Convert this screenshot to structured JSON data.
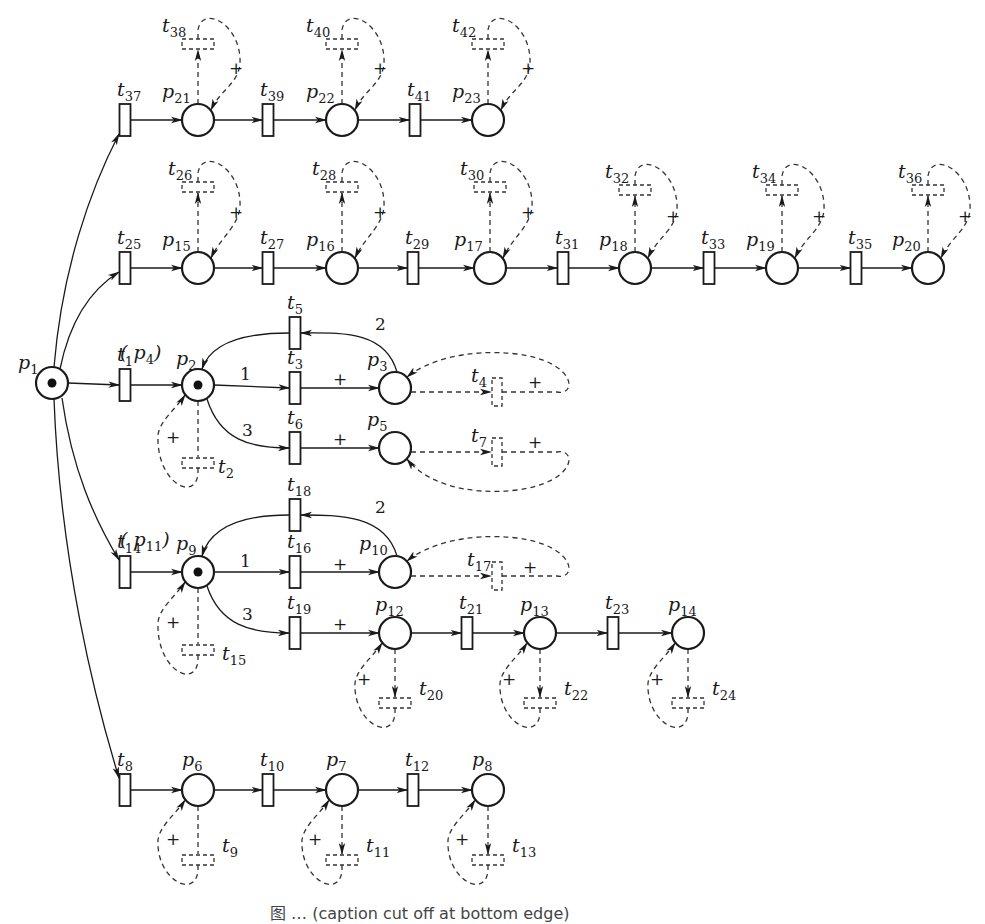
{
  "diagram": {
    "type": "petri-net",
    "caption": "图 … (caption cut off at bottom edge)",
    "places": [
      {
        "id": "p1",
        "x": 52,
        "y": 383,
        "token": true,
        "label_dx": -34,
        "label_dy": -14
      },
      {
        "id": "p2",
        "x": 198,
        "y": 385,
        "token": true,
        "label_dx": -22,
        "label_dy": -20,
        "alias": "(p4)"
      },
      {
        "id": "p3",
        "x": 395,
        "y": 388,
        "token": false,
        "label_dx": -28,
        "label_dy": -22
      },
      {
        "id": "p5",
        "x": 395,
        "y": 448,
        "token": false,
        "label_dx": -28,
        "label_dy": -22
      },
      {
        "id": "p9",
        "x": 198,
        "y": 572,
        "token": true,
        "label_dx": -22,
        "label_dy": -22,
        "alias": "(p11)"
      },
      {
        "id": "p10",
        "x": 395,
        "y": 572,
        "token": false,
        "label_dx": -36,
        "label_dy": -22
      },
      {
        "id": "p12",
        "x": 395,
        "y": 633,
        "token": false,
        "label_dx": -20,
        "label_dy": -22
      },
      {
        "id": "p13",
        "x": 540,
        "y": 633,
        "token": false,
        "label_dx": -20,
        "label_dy": -22
      },
      {
        "id": "p14",
        "x": 688,
        "y": 633,
        "token": false,
        "label_dx": -20,
        "label_dy": -22
      },
      {
        "id": "p6",
        "x": 198,
        "y": 790,
        "token": false,
        "label_dx": -16,
        "label_dy": -24
      },
      {
        "id": "p7",
        "x": 342,
        "y": 790,
        "token": false,
        "label_dx": -16,
        "label_dy": -24
      },
      {
        "id": "p8",
        "x": 488,
        "y": 790,
        "token": false,
        "label_dx": -16,
        "label_dy": -24
      },
      {
        "id": "p15",
        "x": 198,
        "y": 268,
        "token": false,
        "label_dx": -36,
        "label_dy": -22
      },
      {
        "id": "p16",
        "x": 342,
        "y": 268,
        "token": false,
        "label_dx": -36,
        "label_dy": -22
      },
      {
        "id": "p17",
        "x": 490,
        "y": 268,
        "token": false,
        "label_dx": -36,
        "label_dy": -22
      },
      {
        "id": "p18",
        "x": 635,
        "y": 268,
        "token": false,
        "label_dx": -36,
        "label_dy": -22
      },
      {
        "id": "p19",
        "x": 782,
        "y": 268,
        "token": false,
        "label_dx": -36,
        "label_dy": -22
      },
      {
        "id": "p20",
        "x": 928,
        "y": 268,
        "token": false,
        "label_dx": -36,
        "label_dy": -22
      },
      {
        "id": "p21",
        "x": 198,
        "y": 120,
        "token": false,
        "label_dx": -36,
        "label_dy": -22
      },
      {
        "id": "p22",
        "x": 342,
        "y": 120,
        "token": false,
        "label_dx": -36,
        "label_dy": -22
      },
      {
        "id": "p23",
        "x": 488,
        "y": 120,
        "token": false,
        "label_dx": -36,
        "label_dy": -22
      }
    ],
    "transitions": [
      {
        "id": "t1",
        "x": 125,
        "y": 385,
        "visible": true
      },
      {
        "id": "t3",
        "x": 295,
        "y": 388,
        "visible": true
      },
      {
        "id": "t5",
        "x": 295,
        "y": 333,
        "visible": true
      },
      {
        "id": "t6",
        "x": 295,
        "y": 448,
        "visible": true
      },
      {
        "id": "t8",
        "x": 125,
        "y": 790,
        "visible": true
      },
      {
        "id": "t10",
        "x": 268,
        "y": 790,
        "visible": true
      },
      {
        "id": "t12",
        "x": 413,
        "y": 790,
        "visible": true
      },
      {
        "id": "t14",
        "x": 125,
        "y": 572,
        "visible": true
      },
      {
        "id": "t16",
        "x": 295,
        "y": 572,
        "visible": true
      },
      {
        "id": "t18",
        "x": 295,
        "y": 515,
        "visible": true
      },
      {
        "id": "t19",
        "x": 295,
        "y": 633,
        "visible": true
      },
      {
        "id": "t21",
        "x": 467,
        "y": 633,
        "visible": true
      },
      {
        "id": "t23",
        "x": 613,
        "y": 633,
        "visible": true
      },
      {
        "id": "t25",
        "x": 125,
        "y": 268,
        "visible": true
      },
      {
        "id": "t27",
        "x": 268,
        "y": 268,
        "visible": true
      },
      {
        "id": "t29",
        "x": 413,
        "y": 268,
        "visible": true
      },
      {
        "id": "t31",
        "x": 563,
        "y": 268,
        "visible": true
      },
      {
        "id": "t33",
        "x": 709,
        "y": 268,
        "visible": true
      },
      {
        "id": "t35",
        "x": 856,
        "y": 268,
        "visible": true
      },
      {
        "id": "t37",
        "x": 125,
        "y": 120,
        "visible": true
      },
      {
        "id": "t39",
        "x": 268,
        "y": 120,
        "visible": true
      },
      {
        "id": "t41",
        "x": 415,
        "y": 120,
        "visible": true
      },
      {
        "id": "t2",
        "x": 198,
        "y": 463,
        "visible": false,
        "orient": "h"
      },
      {
        "id": "t4",
        "x": 497,
        "y": 392,
        "visible": false,
        "orient": "v"
      },
      {
        "id": "t7",
        "x": 497,
        "y": 452,
        "visible": false,
        "orient": "v"
      },
      {
        "id": "t9",
        "x": 198,
        "y": 860,
        "visible": false,
        "orient": "h"
      },
      {
        "id": "t11",
        "x": 342,
        "y": 860,
        "visible": false,
        "orient": "h"
      },
      {
        "id": "t13",
        "x": 488,
        "y": 860,
        "visible": false,
        "orient": "h"
      },
      {
        "id": "t15",
        "x": 198,
        "y": 650,
        "visible": false,
        "orient": "h"
      },
      {
        "id": "t17",
        "x": 497,
        "y": 576,
        "visible": false,
        "orient": "v"
      },
      {
        "id": "t20",
        "x": 395,
        "y": 703,
        "visible": false,
        "orient": "h"
      },
      {
        "id": "t22",
        "x": 540,
        "y": 703,
        "visible": false,
        "orient": "h"
      },
      {
        "id": "t24",
        "x": 688,
        "y": 703,
        "visible": false,
        "orient": "h"
      },
      {
        "id": "t26",
        "x": 198,
        "y": 187,
        "visible": false,
        "orient": "h"
      },
      {
        "id": "t28",
        "x": 342,
        "y": 187,
        "visible": false,
        "orient": "h"
      },
      {
        "id": "t30",
        "x": 490,
        "y": 187,
        "visible": false,
        "orient": "h"
      },
      {
        "id": "t32",
        "x": 635,
        "y": 190,
        "visible": false,
        "orient": "h"
      },
      {
        "id": "t34",
        "x": 782,
        "y": 190,
        "visible": false,
        "orient": "h"
      },
      {
        "id": "t36",
        "x": 928,
        "y": 190,
        "visible": false,
        "orient": "h"
      },
      {
        "id": "t38",
        "x": 198,
        "y": 44,
        "visible": false,
        "orient": "h"
      },
      {
        "id": "t40",
        "x": 342,
        "y": 44,
        "visible": false,
        "orient": "h"
      },
      {
        "id": "t42",
        "x": 488,
        "y": 44,
        "visible": false,
        "orient": "h"
      }
    ],
    "arc_weights": [
      {
        "text": "1",
        "x": 240,
        "y": 380
      },
      {
        "text": "3",
        "x": 242,
        "y": 436
      },
      {
        "text": "2",
        "x": 375,
        "y": 330
      },
      {
        "text": "1",
        "x": 240,
        "y": 567
      },
      {
        "text": "3",
        "x": 242,
        "y": 620
      },
      {
        "text": "2",
        "x": 375,
        "y": 513
      }
    ],
    "plus_marks": [
      {
        "x": 333,
        "y": 385
      },
      {
        "x": 333,
        "y": 445
      },
      {
        "x": 528,
        "y": 388
      },
      {
        "x": 528,
        "y": 448
      },
      {
        "x": 166,
        "y": 443
      },
      {
        "x": 333,
        "y": 570
      },
      {
        "x": 333,
        "y": 630
      },
      {
        "x": 523,
        "y": 573
      },
      {
        "x": 166,
        "y": 628
      },
      {
        "x": 357,
        "y": 685
      },
      {
        "x": 502,
        "y": 685
      },
      {
        "x": 650,
        "y": 685
      },
      {
        "x": 166,
        "y": 845
      },
      {
        "x": 308,
        "y": 845
      },
      {
        "x": 455,
        "y": 845
      },
      {
        "x": 229,
        "y": 218
      },
      {
        "x": 373,
        "y": 218
      },
      {
        "x": 521,
        "y": 218
      },
      {
        "x": 666,
        "y": 222
      },
      {
        "x": 812,
        "y": 222
      },
      {
        "x": 958,
        "y": 222
      },
      {
        "x": 229,
        "y": 74
      },
      {
        "x": 373,
        "y": 74
      },
      {
        "x": 521,
        "y": 74
      }
    ]
  }
}
